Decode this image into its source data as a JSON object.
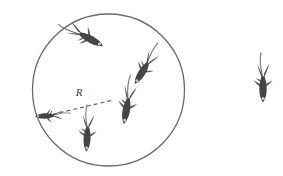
{
  "figure": {
    "kind": "physics-diagram-fish-school",
    "background_color": "#ffffff",
    "width": 283,
    "height": 176
  },
  "boundary_circle": {
    "name": "school-boundary-circle",
    "center_x": 108.5,
    "center_y": 90,
    "radius": 76,
    "stroke_color": "#6a6a6a",
    "stroke_width": 1.3,
    "fill": "none"
  },
  "radius_annotation": {
    "label": "R",
    "label_x": 79,
    "label_y": 96,
    "line_from_x": 46,
    "line_from_y": 116,
    "line_to_x": 113,
    "line_to_y": 100,
    "stroke_color": "#5a5a5a",
    "dash_pattern": "4,3",
    "stroke_width": 1.1
  },
  "palette": {
    "fish_body": "#4a4a4a",
    "fish_body_dark": "#3a3a3a",
    "fish_fin": "#5f5f5f",
    "fish_eye": "#cfcfcf",
    "line_gray": "#6a6a6a"
  },
  "fish": [
    {
      "id": "fish-top-inside",
      "label": "fish-1",
      "x": 92,
      "y": 40,
      "rotation": 118,
      "scale": 1.0,
      "inside_circle": true
    },
    {
      "id": "fish-upper-right-inside",
      "label": "fish-2",
      "x": 141,
      "y": 74,
      "rotation": 212,
      "scale": 0.95,
      "inside_circle": true
    },
    {
      "id": "fish-center-inside",
      "label": "fish-3",
      "x": 126,
      "y": 112,
      "rotation": 190,
      "scale": 1.0,
      "inside_circle": true
    },
    {
      "id": "fish-bottom-inside",
      "label": "fish-4",
      "x": 87,
      "y": 140,
      "rotation": 183,
      "scale": 0.95,
      "inside_circle": true
    },
    {
      "id": "fish-left-edge",
      "label": "fish-5",
      "x": 44,
      "y": 116,
      "rotation": 267,
      "scale": 0.72,
      "inside_circle": false
    },
    {
      "id": "fish-isolated-right",
      "label": "fish-6",
      "x": 263,
      "y": 90,
      "rotation": 180,
      "scale": 1.0,
      "inside_circle": false
    }
  ]
}
